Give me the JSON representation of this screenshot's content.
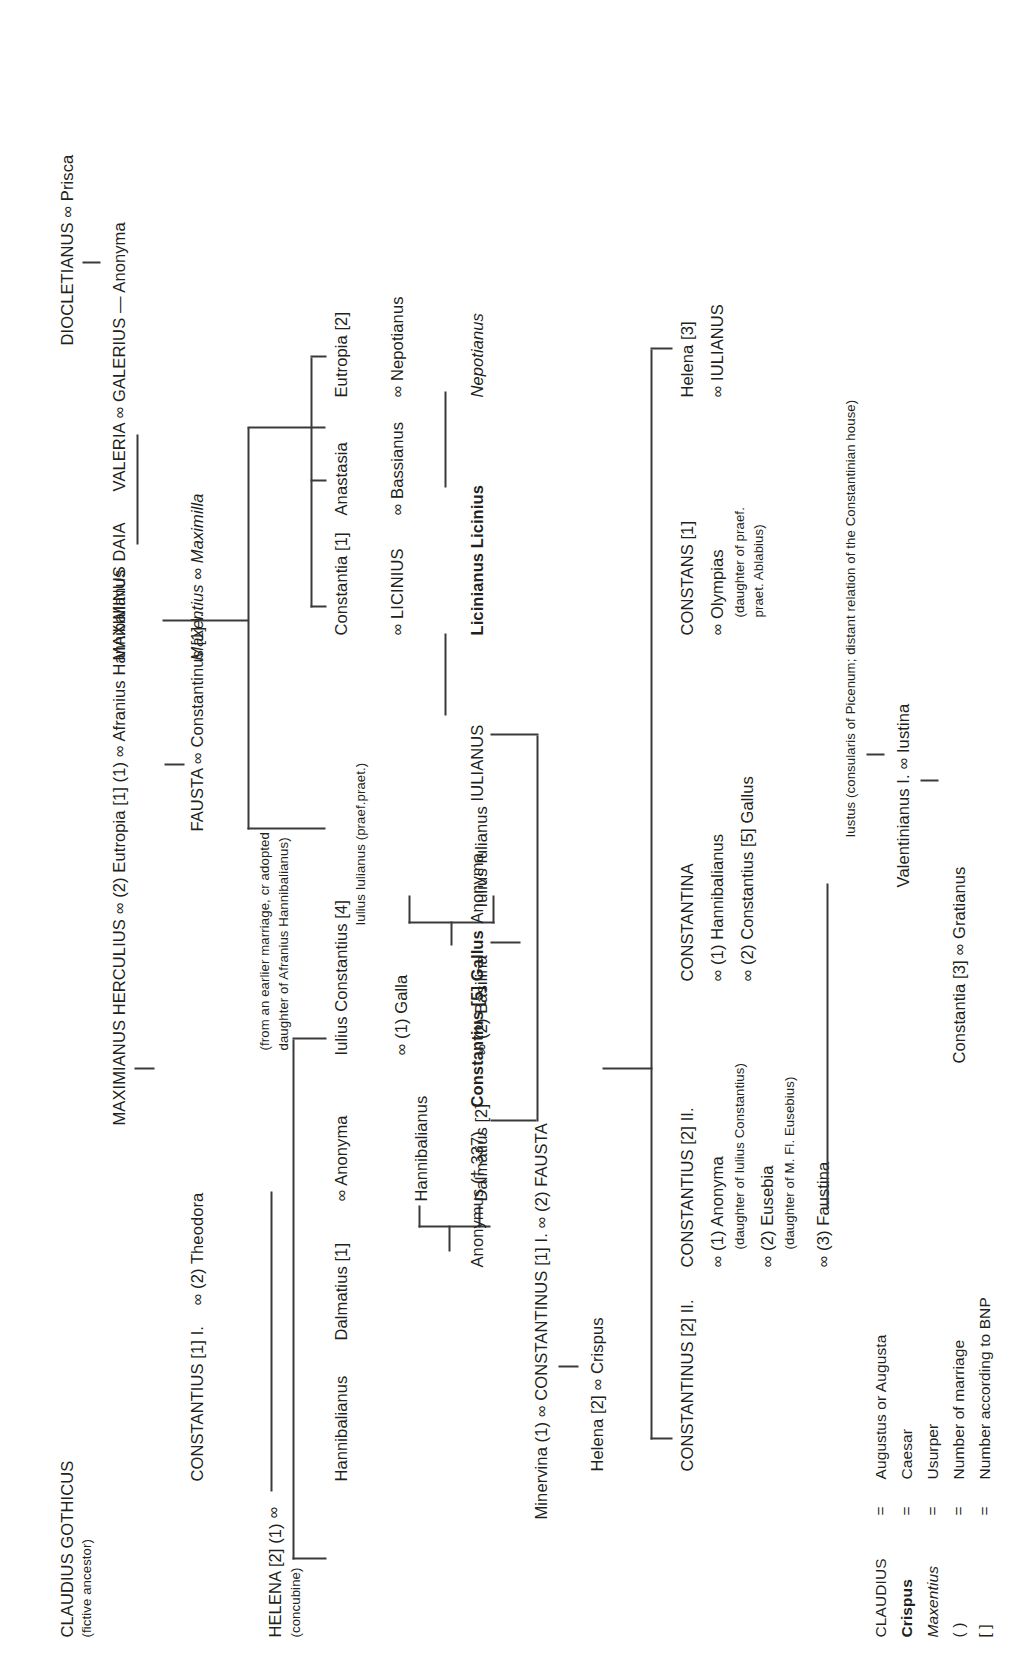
{
  "nodes": {
    "claudius": "CLAUDIUS GOTHICUS",
    "claudius_note": "(fictive ancestor)",
    "diocletianus": "DIOCLETIANUS ∞ Prisca",
    "valeria": "VALERIA ∞ GALERIUS — Anonyma",
    "maximianus": "MAXIMIANUS HERCULIUS  ∞  (2) Eutropia [1] (1) ∞ Afranius Hannibalianus",
    "maximianus_note1": "(from an earlier marriage, cr adopted",
    "maximianus_note2": "daughter of Afranius Hannibalianus)",
    "helena_concubine_1": "HELENA [2] (1)",
    "helena_concubine_2": "(concubine)",
    "helena_marriage": "∞",
    "constantius1": "CONSTANTIUS [1] I.",
    "constantius1_2": "∞  (2) Theodora",
    "maxentius": "Maxentius ∞ Maximilla",
    "maximinus_daia": "MAXIMINUS DAIA",
    "fausta": "FAUSTA ∞ Constantinus [1] I.",
    "hannibalianus_a": "Hannibalianus",
    "dalmatius1": "Dalmatius [1]",
    "anonyma_theodora": "∞ Anonyma",
    "hannibalianus_b": "Hannibalianus",
    "dalmatius2": "Dalmatius [2]",
    "iulius_constantius": "Iulius Constantius [4]",
    "galla": "∞ (1) Galla",
    "basilina": "∞ (2) Basilina",
    "iulius_iulianus_praef": "Iulius Iulianus (praef.praet.)",
    "iulius_iulianus": "Iulius Iulianus",
    "constantia1": "Constantia [1]",
    "licinius": "∞ LICINIUS",
    "anastasia": "Anastasia",
    "bassianus": "∞ Bassianus",
    "eutropia2": "Eutropia [2]",
    "nepotianus_sp": "∞ Nepotianus",
    "nepotianus_it": "Nepotianus",
    "licinianus": "Licinianus Licinius",
    "anonymus_337": "Anonymus († 337)",
    "constantius5_gallus": "Constantius [5] Gallus",
    "anonyma_gallus": "Anonyma",
    "iulianus": "IULIANUS",
    "minervina": "Minervina (1) ∞ CONSTANTINUS [1] I. ∞ (2) FAUSTA",
    "helena2_crispus": "Helena [2] ∞ Crispus",
    "constantinus2": "CONSTANTINUS [2] II.",
    "constantius2": "CONSTANTIUS [2] II.",
    "constantius2_m1": "∞ (1) Anonyma",
    "constantius2_m1_note": "(daughter of Iulius Constantius)",
    "constantius2_m2": "∞ (2) Eusebia",
    "constantius2_m2_note": "(daughter of M. Fl. Eusebius)",
    "constantius2_m3": "∞ (3) Faustina",
    "constantina": "CONSTANTINA",
    "constantina_m1": "∞ (1) Hannibalianus",
    "constantina_m2": "∞ (2) Constantius [5] Gallus",
    "constans": "CONSTANS [1]",
    "olympias": "∞ Olympias",
    "olympias_note1": "(daughter of praef.",
    "olympias_note2": "praet. Ablabius)",
    "helena3": "Helena [3]",
    "iulianus_sp": "∞ IULIANUS",
    "iustus": "Iustus (consularis of Picenum; distant relation of the Constantinian house)",
    "valentinianus_iustina": "Valentinianus I. ∞ Iustina",
    "constantia3_gratianus": "Constantia [3] ∞ Gratianus"
  },
  "legend": {
    "rows": [
      {
        "symbol": "CLAUDIUS",
        "eq": "=",
        "meaning": "Augustus or Augusta",
        "style": "caps"
      },
      {
        "symbol": "Crispus",
        "eq": "=",
        "meaning": "Caesar",
        "style": "bold"
      },
      {
        "symbol": "Maxentius",
        "eq": "=",
        "meaning": "Usurper",
        "style": "italic"
      },
      {
        "symbol": "( )",
        "eq": "=",
        "meaning": "Number of marriage",
        "style": "plain"
      },
      {
        "symbol": "[ ]",
        "eq": "=",
        "meaning": "Number according to BNP",
        "style": "plain"
      }
    ]
  },
  "colors": {
    "ink": "#231f20",
    "rule": "#3a3a3a",
    "background": "#ffffff"
  }
}
